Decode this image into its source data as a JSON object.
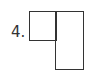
{
  "figure": {
    "label": "4.",
    "shapes": [
      {
        "name": "small-square",
        "type": "rectangle",
        "position": "top-left"
      },
      {
        "name": "tall-rectangle",
        "type": "rectangle",
        "position": "right"
      }
    ],
    "stroke_color": "#333333",
    "background_color": "#ffffff"
  }
}
